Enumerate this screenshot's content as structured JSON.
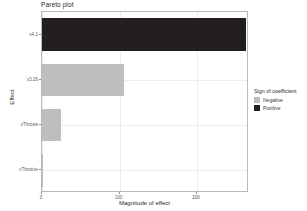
{
  "chart_data": {
    "type": "bar",
    "orientation": "horizontal",
    "title": "Pareto plot",
    "xlabel": "Magnitude of effect",
    "ylabel": "Effect",
    "categories": [
      "x4.1",
      "x3.26",
      "xThrows",
      "xThrotive"
    ],
    "values": [
      263,
      106,
      25,
      1
    ],
    "signs": [
      "Positive",
      "Negative",
      "Negative",
      "Negative"
    ],
    "xlim": [
      0,
      267
    ],
    "xticks": [
      0,
      100,
      200
    ],
    "xtick_labels": [
      "0",
      "100",
      "200"
    ],
    "grid": true,
    "legend_position": "right",
    "series": [
      {
        "name": "Negative",
        "color": "#bebebe",
        "points": [
          {
            "category": "x3.26",
            "value": 106
          },
          {
            "category": "xThrows",
            "value": 25
          },
          {
            "category": "xThrotive",
            "value": 1
          }
        ]
      },
      {
        "name": "Positive",
        "color": "#231f20",
        "points": [
          {
            "category": "x4.1",
            "value": 263
          }
        ]
      }
    ]
  },
  "legend": {
    "title": "Sign of coefficient",
    "items": [
      {
        "label": "Negative",
        "color": "#bebebe"
      },
      {
        "label": "Positive",
        "color": "#231f20"
      }
    ]
  },
  "colors": {
    "negative": "#bebebe",
    "positive": "#231f20",
    "panel_border": "#b9b9b9",
    "grid": "#ededed",
    "text": "#2b2b2b",
    "tick_text": "#5a5a5a",
    "background": "#ffffff"
  }
}
